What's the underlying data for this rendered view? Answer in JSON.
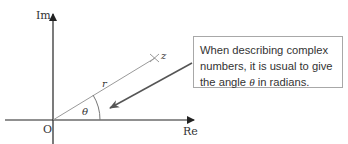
{
  "diagram": {
    "axes": {
      "y_label": "Im",
      "x_label": "Re",
      "origin_label": "O"
    },
    "point_label": "z",
    "modulus_label": "r",
    "angle_label": "θ",
    "callout": {
      "text_before": "When describing complex numbers, it is usual to give the angle ",
      "symbol": "θ",
      "text_after": " in radians."
    },
    "colors": {
      "axis": "#222222",
      "radius_line": "#9a9a9a",
      "arrow": "#555555",
      "box_border": "#a8a8a8",
      "text": "#333333"
    }
  }
}
